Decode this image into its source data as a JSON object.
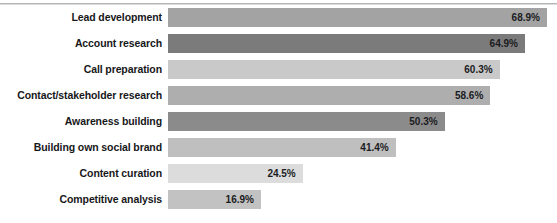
{
  "chart_data": {
    "type": "bar",
    "orientation": "horizontal",
    "title": "",
    "subtitle": "",
    "xlabel": "",
    "ylabel": "",
    "xlim": [
      0,
      70
    ],
    "grid": false,
    "legend": "none",
    "value_suffix": "%",
    "categories": [
      "Lead development",
      "Account research",
      "Call preparation",
      "Contact/stakeholder research",
      "Awareness building",
      "Building own social brand",
      "Content curation",
      "Competitive analysis"
    ],
    "values": [
      68.9,
      64.9,
      60.3,
      58.6,
      50.3,
      41.4,
      24.5,
      16.9
    ],
    "value_labels": [
      "68.9%",
      "64.9%",
      "60.3%",
      "58.6%",
      "50.3%",
      "41.4%",
      "24.5%",
      "16.9%"
    ],
    "bar_colors": [
      "#a3a3a3",
      "#7b7b7b",
      "#c9c9c9",
      "#aeaeae",
      "#8b8b8b",
      "#bfbfbf",
      "#dcdcdc",
      "#c2c2c2"
    ],
    "bars": [
      {
        "category": "Lead development",
        "value": 68.9,
        "label": "68.9%",
        "color": "#a3a3a3"
      },
      {
        "category": "Account research",
        "value": 64.9,
        "label": "64.9%",
        "color": "#7b7b7b"
      },
      {
        "category": "Call preparation",
        "value": 60.3,
        "label": "60.3%",
        "color": "#c9c9c9"
      },
      {
        "category": "Contact/stakeholder research",
        "value": 58.6,
        "label": "58.6%",
        "color": "#aeaeae"
      },
      {
        "category": "Awareness building",
        "value": 50.3,
        "label": "50.3%",
        "color": "#8b8b8b"
      },
      {
        "category": "Building own social brand",
        "value": 41.4,
        "label": "41.4%",
        "color": "#bfbfbf"
      },
      {
        "category": "Content curation",
        "value": 24.5,
        "label": "24.5%",
        "color": "#dcdcdc"
      },
      {
        "category": "Competitive analysis",
        "value": 16.9,
        "label": "16.9%",
        "color": "#c2c2c2"
      }
    ]
  },
  "style": {
    "background": "#ffffff",
    "rule_color": "#b4b4b6",
    "label_color": "#17181a",
    "value_color": "#1b1c1e"
  },
  "geometry": {
    "plot_left_px": 168,
    "px_per_percent": 5.5,
    "bar_height_px": 19,
    "bar_gap_px": 7
  }
}
